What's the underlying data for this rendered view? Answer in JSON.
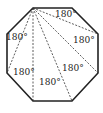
{
  "figure": {
    "shape": "regular octagon",
    "triangle_labels": [
      "180°",
      "180°",
      "180°",
      "180°",
      "180°",
      "180°"
    ],
    "colors": {
      "edge": "#222222",
      "diagonal": "#333333",
      "text": "#222222"
    }
  }
}
